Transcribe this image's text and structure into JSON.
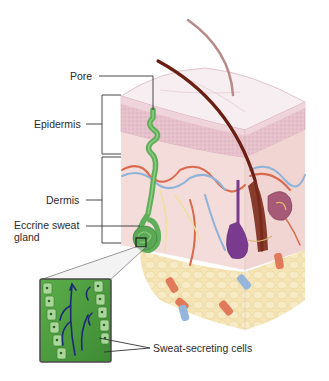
{
  "diagram": {
    "labels": {
      "pore": "Pore",
      "epidermis": "Epidermis",
      "dermis": "Dermis",
      "eccrine_gland_line1": "Eccrine sweat",
      "eccrine_gland_line2": "gland",
      "sweat_cells": "Sweat-secreting cells"
    },
    "colors": {
      "epidermis_top": "#f6eaee",
      "epidermis_layer": "#e9c7d1",
      "dermis": "#f3dbd9",
      "hypodermis_fat": "#f3e2b0",
      "sweat_gland": "#5fae5a",
      "hair_dark": "#6b1f14",
      "hair_light": "#b98a8a",
      "artery": "#d9694d",
      "vein": "#8fb2d8",
      "follicle_bulb": "#7a3b8f",
      "sebaceous": "#9b4f6b",
      "arrow": "#1c2a7a"
    }
  }
}
